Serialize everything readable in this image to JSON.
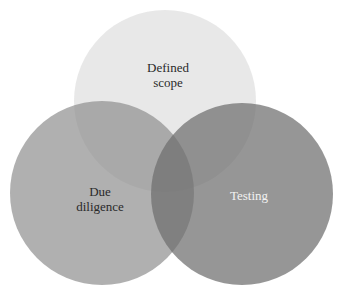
{
  "diagram": {
    "type": "venn",
    "background": "#ffffff",
    "sets": [
      {
        "id": "top",
        "label": "Defined\nscope",
        "cx": 165,
        "cy": 101,
        "r": 91,
        "fill": "#c9c9c9",
        "opacity": 0.42,
        "label_x": 168,
        "label_y": 75,
        "label_color": "#2a2a2a"
      },
      {
        "id": "left",
        "label": "Due\ndiligence",
        "cx": 102,
        "cy": 193,
        "r": 92,
        "fill": "#8f8f8f",
        "opacity": 0.7,
        "label_x": 100,
        "label_y": 199,
        "label_color": "#2a2a2a"
      },
      {
        "id": "right",
        "label": "Testing",
        "cx": 242,
        "cy": 194,
        "r": 91,
        "fill": "#6e6e6e",
        "opacity": 0.72,
        "label_x": 249,
        "label_y": 195,
        "label_color": "#f2f2f2"
      }
    ]
  }
}
